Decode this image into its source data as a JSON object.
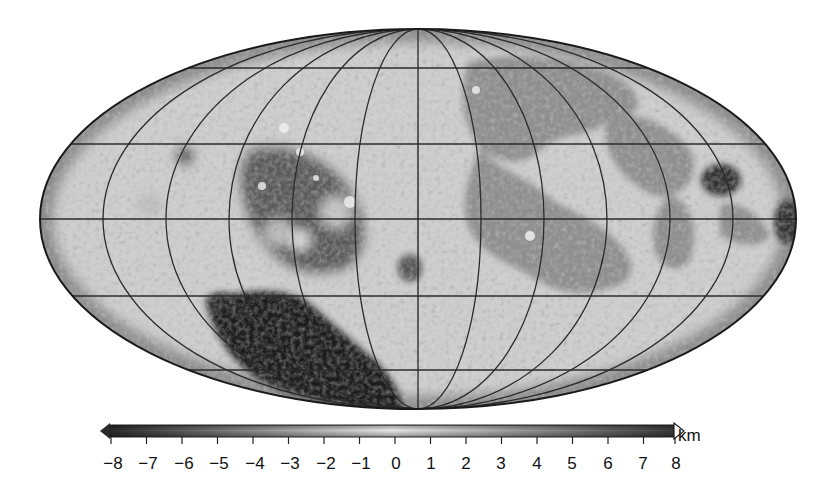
{
  "figure": {
    "type": "topographic-map",
    "projection": "Mollweide (equal-area ellipse)",
    "body": "Moon",
    "colormap": "grayscale",
    "ellipse": {
      "cx": 418,
      "cy": 219,
      "rx": 378,
      "ry": 190
    },
    "graticule": {
      "parallels_count": 5,
      "meridians_count": 13
    }
  },
  "colorbar": {
    "unit": "km",
    "min": -8,
    "max": 8,
    "ticks": [
      "−8",
      "−7",
      "−6",
      "−5",
      "−4",
      "−3",
      "−2",
      "−1",
      "0",
      "1",
      "2",
      "3",
      "4",
      "5",
      "6",
      "7",
      "8"
    ],
    "low_color": "#2a2a2a",
    "mid_color": "#e6e6e6",
    "high_color": "#3a3a3a",
    "left_arrow": "triangle-left",
    "right_arrow": "triangle-right-outline"
  },
  "regions": [
    {
      "name": "south-pole-aitken-basin",
      "shade": "#1e1e1e"
    },
    {
      "name": "maria-nearside",
      "shade": "#8e8e8e"
    },
    {
      "name": "mare-crisium",
      "shade": "#3a3a3a"
    },
    {
      "name": "orientale-basin",
      "shade": "#5a5a5a"
    },
    {
      "name": "highlands",
      "shade": "#d4d4d4"
    }
  ]
}
